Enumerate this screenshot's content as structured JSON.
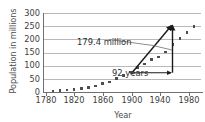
{
  "chart_data": {
    "type": "scatter",
    "title": "",
    "xlabel": "Year",
    "ylabel": "Population in millions",
    "xlim": [
      1780,
      2000
    ],
    "ylim": [
      0,
      300
    ],
    "xticks": [
      1780,
      1820,
      1860,
      1900,
      1940,
      1980
    ],
    "yticks": [
      0,
      50,
      100,
      150,
      200,
      250,
      300
    ],
    "grid": true,
    "legend": null,
    "series": [
      {
        "name": "U.S. population",
        "x": [
          1790,
          1800,
          1810,
          1820,
          1830,
          1840,
          1850,
          1860,
          1870,
          1880,
          1890,
          1900,
          1910,
          1920,
          1930,
          1940,
          1950,
          1960,
          1970,
          1980,
          1990
        ],
        "values": [
          3.9,
          5.3,
          7.2,
          9.6,
          12.9,
          17.1,
          23.2,
          31.4,
          38.6,
          50.2,
          63.0,
          76.2,
          92.2,
          106.0,
          123.2,
          132.2,
          151.3,
          179.3,
          203.3,
          226.5,
          248.7
        ]
      }
    ],
    "annotations": [
      {
        "label": "179.4 million",
        "kind": "vertical-arrow",
        "x": 1992,
        "y_start": 76.2,
        "y_end": 255.6,
        "value": 179.4,
        "units": "million"
      },
      {
        "label": "92 years",
        "kind": "horizontal-arrow",
        "y": 76.2,
        "x_start": 1900,
        "x_end": 1992,
        "value": 92,
        "units": "years"
      },
      {
        "label": "",
        "kind": "trend-arrow",
        "x_start": 1900,
        "y_start": 76.2,
        "x_end": 1992,
        "y_end": 255.6
      }
    ],
    "colors": {
      "point": "#4d4d4d",
      "grid": "#b9b9b9",
      "axis": "#6f6f6f",
      "annotation": "#2f2f2f",
      "arrow": "#1a1a1a",
      "leader": "#6f6f6f",
      "background": "#ffffff"
    }
  },
  "axes": {
    "x_title": "Year",
    "y_title": "Population in millions",
    "x_tick_labels": [
      "1780",
      "1820",
      "1860",
      "1900",
      "1940",
      "1980"
    ],
    "y_tick_labels": [
      "300",
      "250",
      "200",
      "150",
      "100",
      "50",
      "0"
    ]
  },
  "annotations": {
    "amount": "179.4 million",
    "years": "92 years"
  }
}
